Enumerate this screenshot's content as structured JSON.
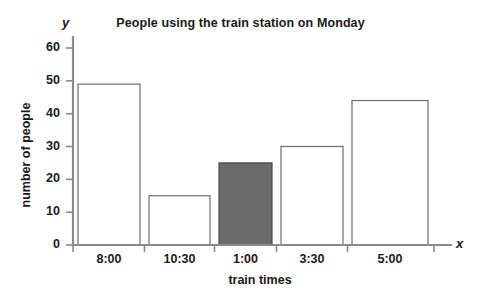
{
  "chart_data": {
    "type": "bar",
    "title": "People using the train station on Monday",
    "xlabel": "train times",
    "ylabel": "number of people",
    "categories": [
      "8:00",
      "10:30",
      "1:00",
      "3:30",
      "5:00"
    ],
    "values": [
      49,
      15,
      25,
      30,
      44
    ],
    "ylim": [
      0,
      60
    ],
    "yticks": [
      0,
      10,
      20,
      30,
      40,
      50,
      60
    ],
    "ytick_labels": [
      "0",
      "10",
      "20",
      "30",
      "40",
      "50",
      "60"
    ],
    "grid": false,
    "legend": null,
    "axis_letters": {
      "x": "x",
      "y": "y"
    },
    "bar_styles": [
      {
        "category": "8:00",
        "fill": "#ffffff",
        "stroke": "#6e6e6e",
        "highlighted": false
      },
      {
        "category": "10:30",
        "fill": "#ffffff",
        "stroke": "#6e6e6e",
        "highlighted": false
      },
      {
        "category": "1:00",
        "fill": "#6b6b6b",
        "stroke": "#4a4a4a",
        "highlighted": true
      },
      {
        "category": "3:30",
        "fill": "#ffffff",
        "stroke": "#6e6e6e",
        "highlighted": false
      },
      {
        "category": "5:00",
        "fill": "#ffffff",
        "stroke": "#6e6e6e",
        "highlighted": false
      }
    ],
    "colors": {
      "axis": "#8a8a8a",
      "bar_outline": "#6e6e6e",
      "bar_fill": "#ffffff",
      "highlight_fill": "#6b6b6b",
      "text": "#1a1a1a",
      "background": "#ffffff"
    }
  }
}
